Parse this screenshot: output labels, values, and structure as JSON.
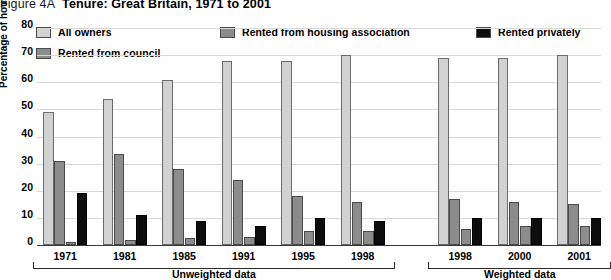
{
  "title": {
    "figure_number": "Figure 4A",
    "text": "Tenure: Great Britain, 1971 to 2001"
  },
  "legend": {
    "position": "top",
    "items": [
      {
        "label": "All owners",
        "color": "#d2d2d2",
        "key": "all_owners"
      },
      {
        "label": "Rented from housing association",
        "color": "#8c8c8c",
        "key": "housing_association"
      },
      {
        "label": "Rented privately",
        "color": "#0d0d0d",
        "key": "privately"
      },
      {
        "label": "Rented from council",
        "color": "#8c8c8c",
        "key": "council"
      }
    ]
  },
  "axes": {
    "ylabel": "Percentage of households",
    "yticks": [
      "0",
      "10",
      "20",
      "30",
      "40",
      "50",
      "60",
      "70",
      "80"
    ],
    "ymin": 0,
    "ymax": 80
  },
  "groups": [
    {
      "label": "Unweighted data"
    },
    {
      "label": "Weighted data"
    }
  ],
  "chart_data": {
    "type": "bar",
    "title": "Tenure: Great Britain, 1971 to 2001",
    "xlabel": "",
    "ylabel": "Percentage of households",
    "ylim": [
      0,
      80
    ],
    "ytick_step": 10,
    "grid": true,
    "legend_position": "top",
    "categories": [
      "1971",
      "1981",
      "1985",
      "1991",
      "1995",
      "1998",
      "1998",
      "2000",
      "2001"
    ],
    "category_groups": [
      {
        "name": "Unweighted data",
        "categories": [
          "1971",
          "1981",
          "1985",
          "1991",
          "1995",
          "1998"
        ]
      },
      {
        "name": "Weighted data",
        "categories": [
          "1998",
          "2000",
          "2001"
        ]
      }
    ],
    "series": [
      {
        "name": "All owners",
        "color": "#d2d2d2",
        "values": [
          49,
          54,
          61,
          68,
          68,
          70,
          69,
          69,
          70
        ]
      },
      {
        "name": "Rented from council",
        "color": "#8c8c8c",
        "values": [
          31,
          33.5,
          28,
          24,
          18,
          16,
          17,
          16,
          15
        ]
      },
      {
        "name": "Rented from housing association",
        "color": "#8c8c8c",
        "values": [
          1,
          2,
          2.5,
          3,
          5,
          5,
          6,
          7,
          7
        ]
      },
      {
        "name": "Rented privately",
        "color": "#0d0d0d",
        "values": [
          19,
          11,
          9,
          7,
          10,
          9,
          10,
          10,
          10
        ]
      }
    ]
  }
}
